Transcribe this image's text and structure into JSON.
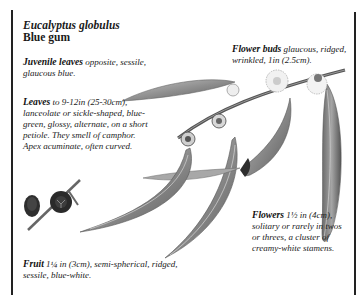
{
  "species": {
    "scientific_name": "Eucalyptus globulus",
    "common_name": "Blue gum"
  },
  "annotations": {
    "juvenile_leaves": {
      "label": "Juvenile leaves",
      "text": " opposite, sessile, glaucous blue."
    },
    "leaves": {
      "label": "Leaves",
      "text": " to 9-12in (25-30cm), lanceolate or sickle-shaped, blue-green, glossy, alternate, on a short petiole. They smell of camphor. Apex acuminate, often curved."
    },
    "flower_buds": {
      "label": "Flower buds",
      "text": " glaucous, ridged, wrinkled, 1in (2.5cm)."
    },
    "flowers": {
      "label": "Flowers",
      "text": " 1½ in (4cm), solitary or rarely in twos or threes, a cluster of creamy-white stamens."
    },
    "fruit": {
      "label": "Fruit",
      "text": " 1¼ in (3cm), semi-spherical, ridged, sessile, blue-white."
    }
  },
  "illustration": {
    "subject": "eucalyptus-branch-with-leaves-buds-flowers-fruit",
    "colors": {
      "leaf": "#9a9a9a",
      "leaf_dark": "#4a4a4a",
      "stem": "#555555",
      "flower": "#e8e8e8",
      "fruit": "#2e2e2e"
    }
  }
}
